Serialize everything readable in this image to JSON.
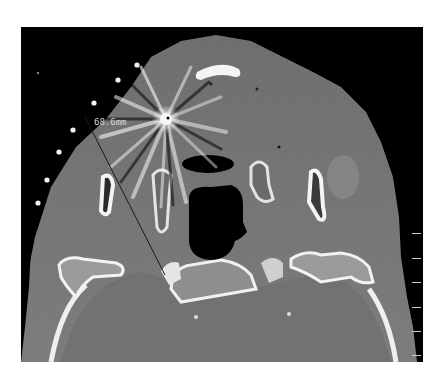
{
  "image": {
    "modality": "CT axial slice",
    "background": "#000000",
    "soft_tissue_color": "#7a7a7a",
    "bone_color": "#e8e8e8",
    "air_color": "#000000"
  },
  "annotations": {
    "measurement": {
      "label": "68.6mm",
      "line": {
        "x1": 64,
        "y1": 90,
        "x2": 144,
        "y2": 248
      }
    },
    "fiducial_markers": [
      {
        "x": 116,
        "y": 38
      },
      {
        "x": 97,
        "y": 53
      },
      {
        "x": 73,
        "y": 76
      },
      {
        "x": 52,
        "y": 103
      },
      {
        "x": 38,
        "y": 125
      },
      {
        "x": 26,
        "y": 153
      },
      {
        "x": 17,
        "y": 176
      }
    ]
  },
  "scale_bar": {
    "ticks_y": [
      206,
      231,
      255,
      280,
      304,
      328
    ]
  }
}
